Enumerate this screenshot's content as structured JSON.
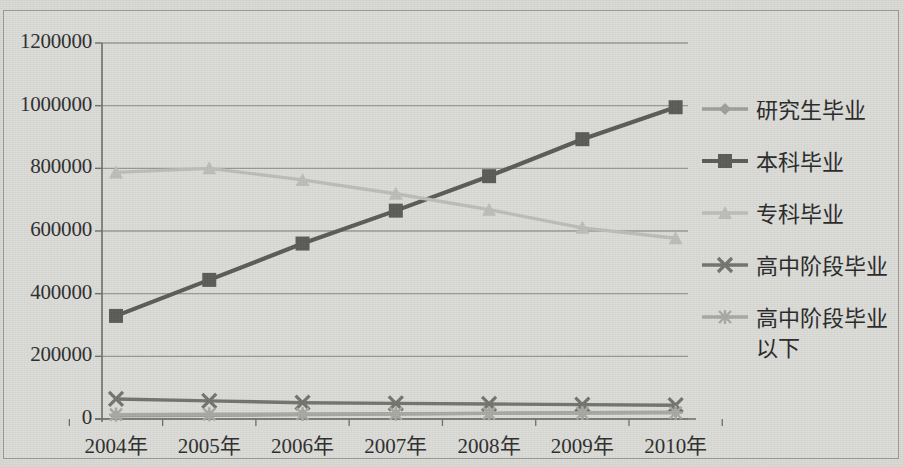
{
  "chart_data": {
    "type": "line",
    "title": "",
    "xlabel": "",
    "ylabel": "",
    "categories": [
      "2004年",
      "2005年",
      "2006年",
      "2007年",
      "2008年",
      "2009年",
      "2010年"
    ],
    "ylim": [
      0,
      1200000
    ],
    "yticks": [
      0,
      200000,
      400000,
      600000,
      800000,
      1000000,
      1200000
    ],
    "ytick_labels": [
      "0",
      "200000",
      "400000",
      "600000",
      "800000",
      "1000000",
      "1200000"
    ],
    "grid": true,
    "legend_position": "right",
    "series": [
      {
        "name": "研究生毕业",
        "marker": "diamond",
        "color": "#9e9e9a",
        "values": [
          10000,
          12000,
          14000,
          16000,
          18000,
          20000,
          22000
        ]
      },
      {
        "name": "本科毕业",
        "marker": "square",
        "color": "#5b5b58",
        "values": [
          329000,
          444000,
          560000,
          665000,
          775000,
          893000,
          995000
        ]
      },
      {
        "name": "专科毕业",
        "marker": "triangle",
        "color": "#bdbdb9",
        "values": [
          787000,
          800000,
          763000,
          719000,
          668000,
          610000,
          577000
        ]
      },
      {
        "name": "高中阶段毕业",
        "marker": "cross-x",
        "color": "#74746f",
        "values": [
          64000,
          58000,
          52000,
          50000,
          48000,
          46000,
          44000
        ]
      },
      {
        "name": "高中阶段毕业\n以下",
        "marker": "asterisk",
        "color": "#a9a9a4",
        "values": [
          14000,
          15000,
          16000,
          17000,
          18000,
          19000,
          20000
        ]
      }
    ]
  },
  "axes": {
    "plot_left_px": 102,
    "plot_right_px": 688,
    "plot_top_px": 43,
    "plot_bottom_px": 419
  },
  "colors": {
    "background": "#d9d9d6",
    "frame_border": "#9a9a96",
    "gridline": "#8e8e8a",
    "axis": "#6d6d69",
    "text": "#2e2e2e"
  }
}
